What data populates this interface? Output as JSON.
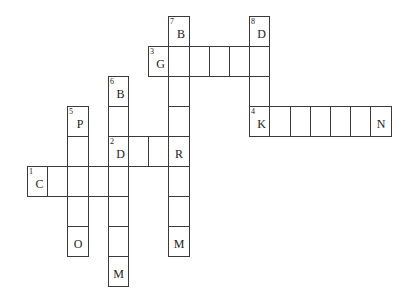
{
  "crossword": {
    "cell_width": 20.2,
    "cell_height": 30,
    "origin_x": 27,
    "origin_y": 16,
    "cells": [
      {
        "col": 7,
        "row": 0,
        "num": "7",
        "letter": "B"
      },
      {
        "col": 11,
        "row": 0,
        "num": "8",
        "letter": "D"
      },
      {
        "col": 6,
        "row": 1,
        "num": "3",
        "letter": "G"
      },
      {
        "col": 7,
        "row": 1,
        "num": "",
        "letter": ""
      },
      {
        "col": 8,
        "row": 1,
        "num": "",
        "letter": ""
      },
      {
        "col": 9,
        "row": 1,
        "num": "",
        "letter": ""
      },
      {
        "col": 10,
        "row": 1,
        "num": "",
        "letter": ""
      },
      {
        "col": 11,
        "row": 1,
        "num": "",
        "letter": ""
      },
      {
        "col": 4,
        "row": 2,
        "num": "6",
        "letter": "B"
      },
      {
        "col": 7,
        "row": 2,
        "num": "",
        "letter": ""
      },
      {
        "col": 11,
        "row": 2,
        "num": "",
        "letter": ""
      },
      {
        "col": 2,
        "row": 3,
        "num": "5",
        "letter": "P"
      },
      {
        "col": 4,
        "row": 3,
        "num": "",
        "letter": ""
      },
      {
        "col": 7,
        "row": 3,
        "num": "",
        "letter": ""
      },
      {
        "col": 11,
        "row": 3,
        "num": "4",
        "letter": "K"
      },
      {
        "col": 12,
        "row": 3,
        "num": "",
        "letter": ""
      },
      {
        "col": 13,
        "row": 3,
        "num": "",
        "letter": ""
      },
      {
        "col": 14,
        "row": 3,
        "num": "",
        "letter": ""
      },
      {
        "col": 15,
        "row": 3,
        "num": "",
        "letter": ""
      },
      {
        "col": 16,
        "row": 3,
        "num": "",
        "letter": ""
      },
      {
        "col": 17,
        "row": 3,
        "num": "",
        "letter": "N"
      },
      {
        "col": 2,
        "row": 4,
        "num": "",
        "letter": ""
      },
      {
        "col": 4,
        "row": 4,
        "num": "2",
        "letter": "D"
      },
      {
        "col": 5,
        "row": 4,
        "num": "",
        "letter": ""
      },
      {
        "col": 6,
        "row": 4,
        "num": "",
        "letter": ""
      },
      {
        "col": 7,
        "row": 4,
        "num": "",
        "letter": "R"
      },
      {
        "col": 0,
        "row": 5,
        "num": "1",
        "letter": "C"
      },
      {
        "col": 1,
        "row": 5,
        "num": "",
        "letter": ""
      },
      {
        "col": 2,
        "row": 5,
        "num": "",
        "letter": ""
      },
      {
        "col": 3,
        "row": 5,
        "num": "",
        "letter": ""
      },
      {
        "col": 4,
        "row": 5,
        "num": "",
        "letter": ""
      },
      {
        "col": 7,
        "row": 5,
        "num": "",
        "letter": ""
      },
      {
        "col": 2,
        "row": 6,
        "num": "",
        "letter": ""
      },
      {
        "col": 4,
        "row": 6,
        "num": "",
        "letter": ""
      },
      {
        "col": 7,
        "row": 6,
        "num": "",
        "letter": ""
      },
      {
        "col": 2,
        "row": 7,
        "num": "",
        "letter": "O"
      },
      {
        "col": 4,
        "row": 7,
        "num": "",
        "letter": ""
      },
      {
        "col": 7,
        "row": 7,
        "num": "",
        "letter": "M"
      },
      {
        "col": 4,
        "row": 8,
        "num": "",
        "letter": "M"
      }
    ]
  }
}
